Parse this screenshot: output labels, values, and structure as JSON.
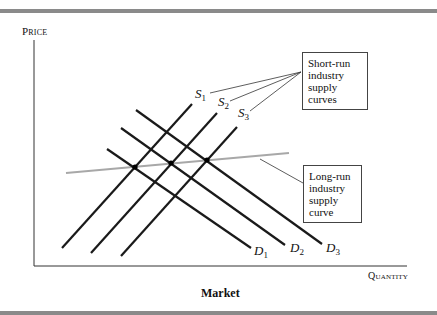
{
  "figure": {
    "caption": "Market",
    "y_axis_label": "Price",
    "x_axis_label": "Quantity",
    "annotations": {
      "short_run": [
        "Short-run",
        "industry",
        "supply curves"
      ],
      "long_run": [
        "Long-run",
        "industry",
        "supply curve"
      ]
    },
    "curve_labels": {
      "s1": "S",
      "s1_sub": "1",
      "s2": "S",
      "s2_sub": "2",
      "s3": "S",
      "s3_sub": "3",
      "d1": "D",
      "d1_sub": "1",
      "d2": "D",
      "d2_sub": "2",
      "d3": "D",
      "d3_sub": "3"
    },
    "colors": {
      "curve": "#1a1a1a",
      "long_run_curve": "#a8a8a8",
      "axis": "#333333",
      "rule": "#8a8a8a"
    }
  }
}
